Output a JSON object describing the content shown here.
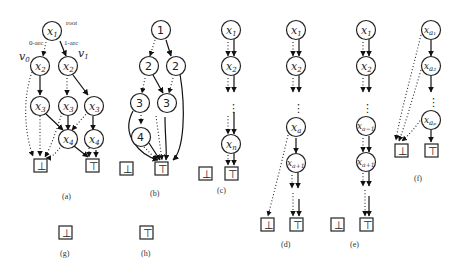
{
  "figure": {
    "panel_a": {
      "caption": "(a)",
      "root_label": "root",
      "zero_arc_label": "0-arc",
      "one_arc_label": "1-arc",
      "v0_label": "v",
      "v0_sub": "0",
      "v1_label": "v",
      "v1_sub": "1",
      "nodes": [
        {
          "var": "x",
          "sub": "1"
        },
        {
          "var": "x",
          "sub": "2"
        },
        {
          "var": "x",
          "sub": "2"
        },
        {
          "var": "x",
          "sub": "3"
        },
        {
          "var": "x",
          "sub": "3"
        },
        {
          "var": "x",
          "sub": "3"
        },
        {
          "var": "x",
          "sub": "4"
        },
        {
          "var": "x",
          "sub": "4"
        }
      ],
      "false_terminal": "⊥",
      "true_terminal": "⊤"
    },
    "panel_b": {
      "caption": "(b)",
      "nodes": [
        "1",
        "2",
        "2",
        "3",
        "3",
        "4"
      ],
      "false_terminal": "⊥",
      "true_terminal": "⊤"
    },
    "panel_c": {
      "caption": "(c)",
      "nodes": [
        {
          "var": "x",
          "sub": "1"
        },
        {
          "var": "x",
          "sub": "2"
        },
        {
          "var": "x",
          "sub": "n"
        }
      ],
      "ellipsis": "⋮",
      "false_terminal": "⊥",
      "true_terminal": "⊤"
    },
    "panel_d": {
      "caption": "(d)",
      "nodes": [
        {
          "var": "x",
          "sub": "1"
        },
        {
          "var": "x",
          "sub": "2"
        },
        {
          "var": "x",
          "sub": "a"
        },
        {
          "var": "x",
          "sub": "a+1"
        }
      ],
      "ellipsis": "⋮",
      "false_terminal": "⊥",
      "true_terminal": "⊤"
    },
    "panel_e": {
      "caption": "(e)",
      "nodes": [
        {
          "var": "x",
          "sub": "1"
        },
        {
          "var": "x",
          "sub": "2"
        },
        {
          "var": "x",
          "sub": "a−1"
        },
        {
          "var": "x",
          "sub": "a+1"
        }
      ],
      "ellipsis": "⋮",
      "false_terminal": "⊥",
      "true_terminal": "⊤"
    },
    "panel_f": {
      "caption": "(f)",
      "nodes": [
        {
          "var": "x",
          "sub": "a₁"
        },
        {
          "var": "x",
          "sub": "a₂"
        },
        {
          "var": "x",
          "sub": "aₚ"
        }
      ],
      "ellipsis": "⋮",
      "false_terminal": "⊥",
      "true_terminal": "⊤"
    },
    "panel_g": {
      "caption": "(g)",
      "terminal": "⊥"
    },
    "panel_h": {
      "caption": "(h)",
      "terminal": "⊤"
    }
  }
}
